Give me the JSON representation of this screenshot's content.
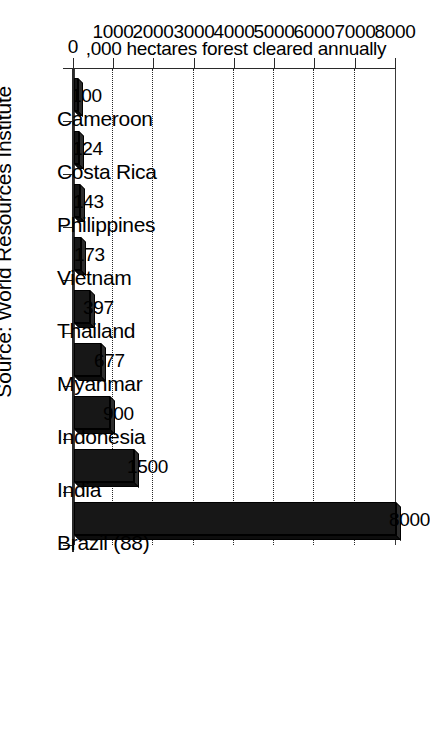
{
  "chart_data": {
    "type": "bar",
    "orientation": "vertical",
    "title": "",
    "subtitle": "",
    "xlabel": "",
    "ylabel": ",000 hectares forest cleared annually",
    "categories": [
      "Cameroon",
      "Costa Rica",
      "Philippines",
      "Vietnam",
      "Thailand",
      "Myanmar",
      "Indonesia",
      "India",
      "Brazil (88)"
    ],
    "values": [
      100,
      124,
      143,
      173,
      397,
      677,
      900,
      1500,
      8000
    ],
    "data_labels": [
      "100",
      "124",
      "143",
      "173",
      "397",
      "677",
      "900",
      "1500",
      "8000"
    ],
    "ylim": [
      0,
      8000
    ],
    "ytick_labels": [
      "0",
      "1000",
      "2000",
      "3000",
      "4000",
      "5000",
      "6000",
      "7000",
      "8000"
    ],
    "ytick_values": [
      0,
      1000,
      2000,
      3000,
      4000,
      5000,
      6000,
      7000,
      8000
    ],
    "grid": true,
    "gridline_values": [
      1000,
      2000,
      3000,
      4000,
      5000,
      6000,
      7000
    ],
    "legend": false,
    "legend_position": "none",
    "bar_color": "#171717",
    "grid_color": "#2a2a2a",
    "axis_color": "#2a2a2a"
  },
  "figure": {
    "source_note": "Source: World Resources Institute",
    "page_rotation_degrees": 90
  }
}
